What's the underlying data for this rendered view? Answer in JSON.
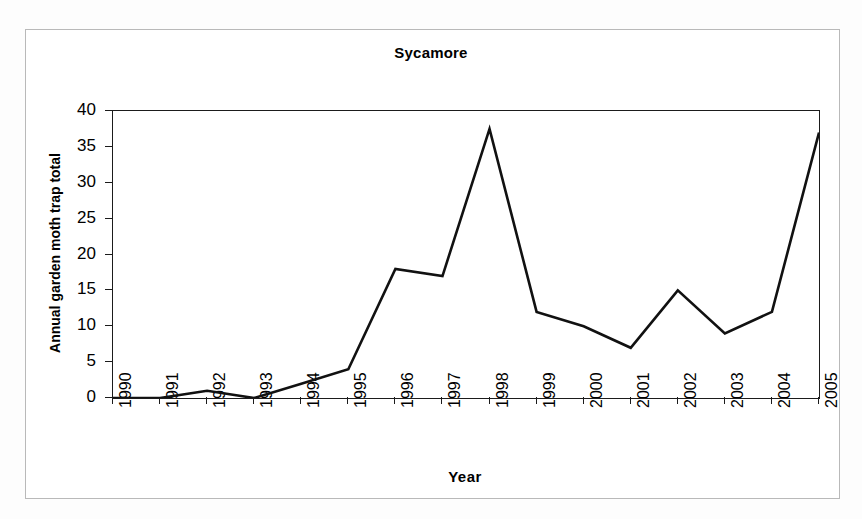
{
  "chart_data": {
    "type": "line",
    "title": "Sycamore",
    "xlabel": "Year",
    "ylabel": "Annual garden moth trap total",
    "categories": [
      "1990",
      "1991",
      "1992",
      "1993",
      "1994",
      "1995",
      "1996",
      "1997",
      "1998",
      "1999",
      "2000",
      "2001",
      "2002",
      "2003",
      "2004",
      "2005"
    ],
    "values": [
      0,
      0,
      1,
      0,
      2,
      4,
      18,
      17,
      37.5,
      12,
      10,
      7,
      15,
      9,
      12,
      37
    ],
    "series": [
      {
        "name": "Sycamore",
        "values": [
          0,
          0,
          1,
          0,
          2,
          4,
          18,
          17,
          37.5,
          12,
          10,
          7,
          15,
          9,
          12,
          37
        ]
      }
    ],
    "xlim": [
      1990,
      2005
    ],
    "ylim": [
      0,
      40
    ],
    "ytick_labels": [
      "0",
      "5",
      "10",
      "15",
      "20",
      "25",
      "30",
      "35",
      "40"
    ],
    "ytick_values": [
      0,
      5,
      10,
      15,
      20,
      25,
      30,
      35,
      40
    ],
    "grid": false,
    "legend": false,
    "line_color": "#111111",
    "line_width": 2.6,
    "markers": false,
    "axis_color": "#1b1b1b",
    "background_color": "#ffffff",
    "frame_color": "#b9b9b9"
  },
  "figure": {
    "title": "Sycamore",
    "x_axis_title": "Year",
    "y_axis_title": "Annual garden moth trap total"
  }
}
